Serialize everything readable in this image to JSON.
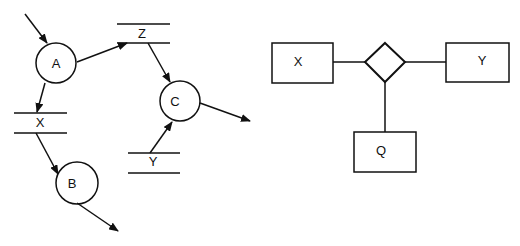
{
  "dfd": {
    "processes": [
      {
        "id": "A",
        "label": "A",
        "cx": 56,
        "cy": 63,
        "r": 20
      },
      {
        "id": "B",
        "label": "B",
        "cx": 77,
        "cy": 183,
        "r": 21
      },
      {
        "id": "C",
        "label": "C",
        "cx": 180,
        "cy": 101,
        "r": 20
      }
    ],
    "stores": [
      {
        "id": "Z",
        "label": "Z",
        "x1": 117,
        "x2": 170,
        "top": 24,
        "bottom": 43
      },
      {
        "id": "X",
        "label": "X",
        "x1": 14,
        "x2": 67,
        "top": 113,
        "bottom": 133
      },
      {
        "id": "Y",
        "label": "Y",
        "x1": 128,
        "x2": 180,
        "top": 153,
        "bottom": 173
      }
    ],
    "flows": [
      {
        "from": "external",
        "to": "A"
      },
      {
        "from": "A",
        "to": "Z"
      },
      {
        "from": "A",
        "to": "X"
      },
      {
        "from": "Z",
        "to": "C"
      },
      {
        "from": "Y",
        "to": "C"
      },
      {
        "from": "X",
        "to": "B"
      },
      {
        "from": "C",
        "to": "external"
      },
      {
        "from": "B",
        "to": "external"
      }
    ]
  },
  "er": {
    "entities": [
      {
        "id": "X",
        "label": "X"
      },
      {
        "id": "Y",
        "label": "Y"
      },
      {
        "id": "Q",
        "label": "Q"
      }
    ],
    "relationship": {
      "shape": "diamond",
      "connects": [
        "X",
        "Y",
        "Q"
      ]
    }
  },
  "colors": {
    "stroke": "#111111",
    "background": "#ffffff"
  }
}
